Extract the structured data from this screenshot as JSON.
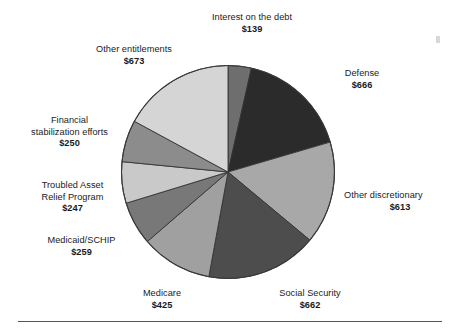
{
  "figure": {
    "background_color": "#ffffff",
    "rule_color": "#555555",
    "label_color": "#1a1a1a"
  },
  "chart_data": {
    "type": "pie",
    "title": "",
    "subtitle": "",
    "xlabel": "",
    "ylabel": "",
    "units": "billions of dollars",
    "value_prefix": "$",
    "total": 3934,
    "start_angle_deg": 0,
    "direction": "clockwise",
    "legend": "none",
    "grid": false,
    "labels_position": "outside-callout",
    "categories": [
      "Interest on the debt",
      "Defense",
      "Other discretionary",
      "Social Security",
      "Medicare",
      "Medicaid/SCHIP",
      "Troubled Asset Relief Program",
      "Financial stabilization efforts",
      "Other entitlements"
    ],
    "values": [
      139,
      666,
      613,
      662,
      425,
      259,
      247,
      250,
      673
    ],
    "slices": [
      {
        "id": "interest",
        "label_lines": [
          "Interest on the debt"
        ],
        "value": 139,
        "value_label": "$139",
        "color": "#6e6e6e",
        "start_deg": 0,
        "end_deg": 12.72
      },
      {
        "id": "defense",
        "label_lines": [
          "Defense"
        ],
        "value": 666,
        "value_label": "$666",
        "color": "#2b2b2b",
        "start_deg": 12.72,
        "end_deg": 73.68
      },
      {
        "id": "other-discretionary",
        "label_lines": [
          "Other discretionary"
        ],
        "value": 613,
        "value_label": "$613",
        "color": "#a8a8a8",
        "start_deg": 73.68,
        "end_deg": 129.78
      },
      {
        "id": "social-security",
        "label_lines": [
          "Social Security"
        ],
        "value": 662,
        "value_label": "$662",
        "color": "#4d4d4d",
        "start_deg": 129.78,
        "end_deg": 190.37
      },
      {
        "id": "medicare",
        "label_lines": [
          "Medicare"
        ],
        "value": 425,
        "value_label": "$425",
        "color": "#a0a0a0",
        "start_deg": 190.37,
        "end_deg": 229.27
      },
      {
        "id": "medicaid-schip",
        "label_lines": [
          "Medicaid/SCHIP"
        ],
        "value": 259,
        "value_label": "$259",
        "color": "#787878",
        "start_deg": 229.27,
        "end_deg": 252.97
      },
      {
        "id": "tarp",
        "label_lines": [
          "Troubled Asset",
          "Relief Program"
        ],
        "value": 247,
        "value_label": "$247",
        "color": "#c9c9c9",
        "start_deg": 252.97,
        "end_deg": 275.58
      },
      {
        "id": "financial-stabilization",
        "label_lines": [
          "Financial",
          "stabilization efforts"
        ],
        "value": 250,
        "value_label": "$250",
        "color": "#8c8c8c",
        "start_deg": 275.58,
        "end_deg": 298.46
      },
      {
        "id": "other-entitlements",
        "label_lines": [
          "Other entitlements"
        ],
        "value": 673,
        "value_label": "$673",
        "color": "#d5d5d5",
        "start_deg": 298.46,
        "end_deg": 360
      }
    ]
  },
  "callouts": {
    "interest": {
      "line1": "Interest on the debt",
      "line2": "",
      "value": "$139"
    },
    "defense": {
      "line1": "Defense",
      "line2": "",
      "value": "$666"
    },
    "other_disc": {
      "line1": "Other discretionary",
      "line2": "",
      "value": "$613"
    },
    "social": {
      "line1": "Social Security",
      "line2": "",
      "value": "$662"
    },
    "medicare": {
      "line1": "Medicare",
      "line2": "",
      "value": "$425"
    },
    "medicaid": {
      "line1": "Medicaid/SCHIP",
      "line2": "",
      "value": "$259"
    },
    "tarp": {
      "line1": "Troubled Asset",
      "line2": "Relief Program",
      "value": "$247"
    },
    "finstab": {
      "line1": "Financial",
      "line2": "stabilization efforts",
      "value": "$250"
    },
    "other_ent": {
      "line1": "Other entitlements",
      "line2": "",
      "value": "$673"
    }
  }
}
